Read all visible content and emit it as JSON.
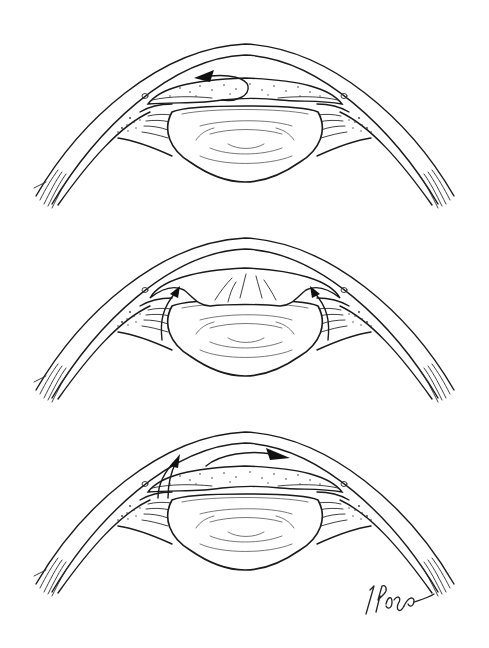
{
  "figure": {
    "description": "Three cross-sectional illustrations of the anterior segment of the eye (cornea, iris, lens, ciliary body) showing aqueous flow directions",
    "panels": [
      {
        "id": "panel-1",
        "arrow": "curved arrow over iris pointing left",
        "offset_y": 0
      },
      {
        "id": "panel-2",
        "arrow": "two arrows rising at both angles",
        "offset_y": 194
      },
      {
        "id": "panel-3",
        "arrow": "hooked arrow from left angle and arrow over iris pointing right",
        "offset_y": 388
      }
    ],
    "signature": "T Phelps",
    "colors": {
      "line": "#1a1a1a",
      "background": "#ffffff"
    }
  }
}
